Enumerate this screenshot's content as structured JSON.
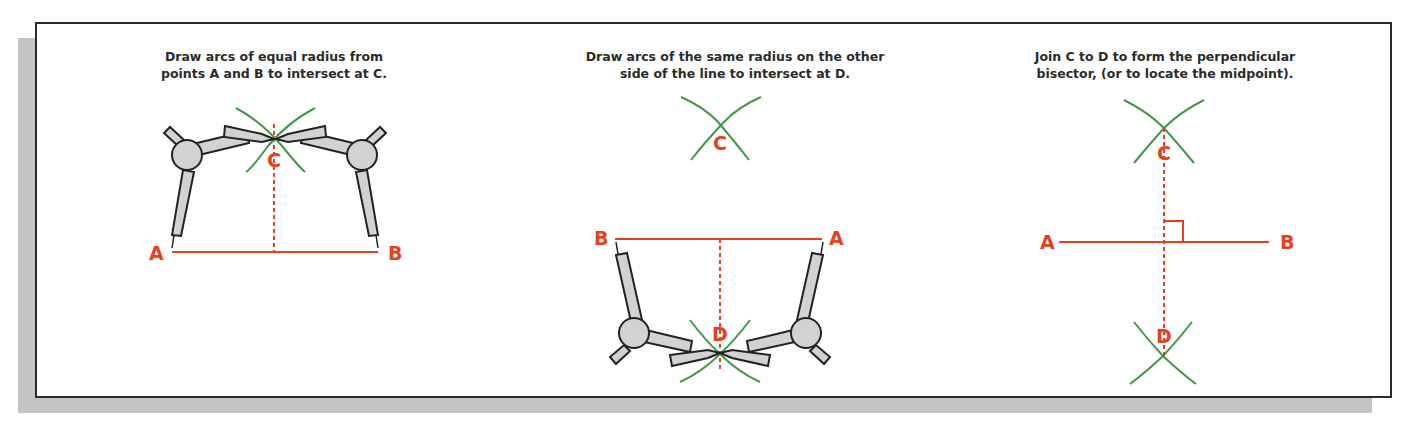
{
  "colors": {
    "line": "#e8401c",
    "arc": "#3f9a48",
    "compass_fill": "#d2d2d2",
    "compass_stroke": "#222222",
    "text": "#2b2b2b",
    "shadow": "#c3c3c3",
    "border": "#2a2a2a"
  },
  "panels": [
    {
      "caption_line1": "Draw arcs of equal radius from",
      "caption_line2": "points A and B to intersect at C.",
      "labels": {
        "a": "A",
        "b": "B",
        "c": "C"
      }
    },
    {
      "caption_line1": "Draw arcs of the same radius on the other",
      "caption_line2": "side of the line to intersect at D.",
      "labels": {
        "a": "A",
        "b": "B",
        "c": "C",
        "d": "D"
      }
    },
    {
      "caption_line1": "Join C to D to form the perpendicular",
      "caption_line2": "bisector, (or to locate the midpoint).",
      "labels": {
        "a": "A",
        "b": "B",
        "c": "C",
        "d": "D"
      }
    }
  ]
}
